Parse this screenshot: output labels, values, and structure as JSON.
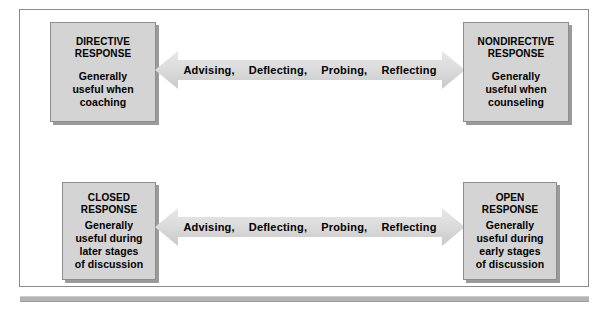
{
  "figure": {
    "background_color": "#ffffff",
    "frame_border_color": "#8a8a8a",
    "box_fill_color": "#d4d4d4",
    "arrow_fill_color": "#d9d9d9",
    "rule_color": "#b4b4b4"
  },
  "rows": [
    {
      "id": "directive-nondirective",
      "left_box": {
        "title_line1": "DIRECTIVE",
        "title_line2": "RESPONSE",
        "desc_line1": "Generally",
        "desc_line2": "useful when",
        "desc_line3": "coaching"
      },
      "right_box": {
        "title_line1": "NONDIRECTIVE",
        "title_line2": "RESPONSE",
        "desc_line1": "Generally",
        "desc_line2": "useful when",
        "desc_line3": "counseling"
      },
      "arrow": {
        "type": "double-headed-arrow",
        "labels": [
          "Advising,",
          "Deflecting,",
          "Probing,",
          "Reflecting"
        ]
      }
    },
    {
      "id": "closed-open",
      "left_box": {
        "title_line1": "CLOSED",
        "title_line2": "RESPONSE",
        "desc_line1": "Generally",
        "desc_line2": "useful during",
        "desc_line3": "later stages",
        "desc_line4": "of discussion"
      },
      "right_box": {
        "title_line1": "OPEN",
        "title_line2": "RESPONSE",
        "desc_line1": "Generally",
        "desc_line2": "useful during",
        "desc_line3": "early stages",
        "desc_line4": "of discussion"
      },
      "arrow": {
        "type": "double-headed-arrow",
        "labels": [
          "Advising,",
          "Deflecting,",
          "Probing,",
          "Reflecting"
        ]
      }
    }
  ]
}
